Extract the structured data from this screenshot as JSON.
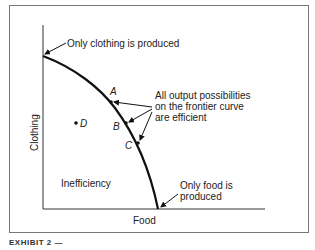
{
  "figure": {
    "caption_fragment": "EXHIBIT 2 —"
  },
  "axes": {
    "x_label": "Food",
    "y_label": "Clothing"
  },
  "annotations": {
    "top": "Only clothing is produced",
    "bottom_line1": "Only food is",
    "bottom_line2": "produced",
    "efficient_line1": "All output possibilities",
    "efficient_line2": "on the frontier curve",
    "efficient_line3": "are efficient",
    "inefficiency": "Inefficiency"
  },
  "points": [
    {
      "label": "A",
      "on_frontier": true
    },
    {
      "label": "B",
      "on_frontier": true
    },
    {
      "label": "C",
      "on_frontier": true
    },
    {
      "label": "D",
      "on_frontier": false
    }
  ],
  "colors": {
    "line": "#111111",
    "frame": "#777777",
    "text": "#222222"
  }
}
